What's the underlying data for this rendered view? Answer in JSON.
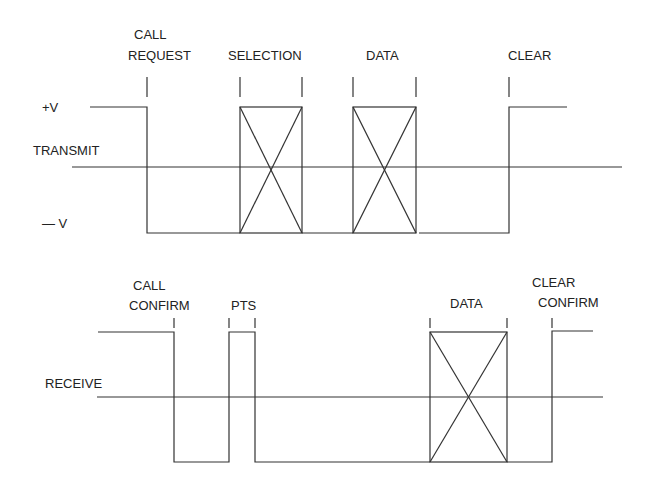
{
  "transmit": {
    "level_high": "+V",
    "axis_label": "TRANSMIT",
    "level_low": "— V",
    "phases": [
      {
        "line1": "CALL",
        "line2": "REQUEST"
      },
      {
        "line1": "",
        "line2": "SELECTION"
      },
      {
        "line1": "",
        "line2": "DATA"
      },
      {
        "line1": "",
        "line2": "CLEAR"
      }
    ]
  },
  "receive": {
    "axis_label": "RECEIVE",
    "phases": [
      {
        "line1": "CALL",
        "line2": "CONFIRM"
      },
      {
        "line1": "",
        "line2": "PTS"
      },
      {
        "line1": "",
        "line2": "DATA"
      },
      {
        "line1": "CLEAR",
        "line2": "CONFIRM"
      }
    ]
  },
  "colors": {
    "line": "#333333",
    "background": "#ffffff"
  }
}
